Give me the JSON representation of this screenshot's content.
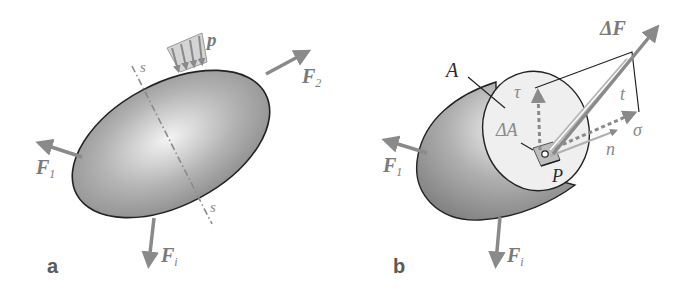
{
  "colors": {
    "body_fill_light": "#f2f2f2",
    "body_fill_dark": "#8e8e8e",
    "arrow": "#8a8a8a",
    "outline": "#222222",
    "label_grey": "#7a7a7a",
    "section_fill": "#efefef"
  },
  "panel_a": {
    "panel_label": "a",
    "force_1": {
      "symbol": "F",
      "subscript": "1"
    },
    "force_2": {
      "symbol": "F",
      "subscript": "2"
    },
    "force_i": {
      "symbol": "F",
      "subscript": "i"
    },
    "distributed_load": "p",
    "section_line_top": "s",
    "section_line_bottom": "s"
  },
  "panel_b": {
    "panel_label": "b",
    "force_1": {
      "symbol": "F",
      "subscript": "1"
    },
    "force_i": {
      "symbol": "F",
      "subscript": "i"
    },
    "area_label": "A",
    "delta_area": "ΔA",
    "delta_force": "ΔF",
    "point": "P",
    "shear_stress": "τ",
    "normal_stress": "σ",
    "stress_vector": "t",
    "normal_vector": "n"
  }
}
